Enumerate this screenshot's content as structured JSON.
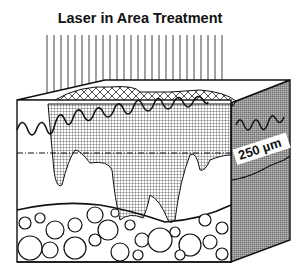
{
  "diagram": {
    "title": "Laser in Area Treatment",
    "depth_label": "250 µm",
    "elements": [
      {
        "name": "laser-beams",
        "description": "Vertical parallel laser lines over the treatment area"
      },
      {
        "name": "skin-block",
        "description": "3D cross-section of skin"
      },
      {
        "name": "epidermis",
        "description": "Wavy upper layer"
      },
      {
        "name": "treated-zone",
        "description": "Cross-hatched thermal zone extending into dermis"
      },
      {
        "name": "depth-marker",
        "description": "Dash-dot line at 250 µm depth"
      },
      {
        "name": "subcutaneous-fat",
        "description": "Circular fat cells at bottom"
      }
    ],
    "colors": {
      "ink": "#111111",
      "background": "#ffffff"
    }
  }
}
